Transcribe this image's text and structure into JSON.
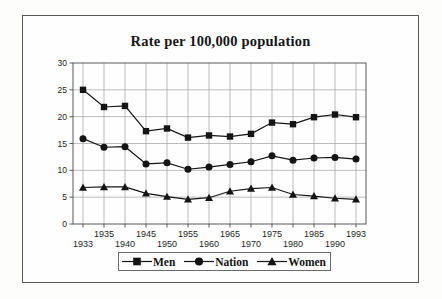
{
  "chart_data": {
    "type": "line",
    "title": "Rate per 100,000 population",
    "categories": [
      "1933",
      "1935",
      "1940",
      "1945",
      "1950",
      "1955",
      "1960",
      "1965",
      "1970",
      "1975",
      "1980",
      "1985",
      "1990",
      "1993"
    ],
    "series": [
      {
        "name": "Men",
        "marker": "square",
        "values": [
          25.0,
          21.8,
          22.0,
          17.3,
          17.8,
          16.1,
          16.5,
          16.3,
          16.8,
          18.9,
          18.6,
          19.9,
          20.4,
          19.9
        ]
      },
      {
        "name": "Nation",
        "marker": "circle",
        "values": [
          15.9,
          14.3,
          14.4,
          11.2,
          11.4,
          10.2,
          10.6,
          11.1,
          11.6,
          12.7,
          11.9,
          12.3,
          12.4,
          12.1
        ]
      },
      {
        "name": "Women",
        "marker": "triangle",
        "values": [
          6.8,
          6.9,
          6.9,
          5.7,
          5.1,
          4.6,
          4.9,
          6.1,
          6.6,
          6.8,
          5.5,
          5.2,
          4.8,
          4.6
        ]
      }
    ],
    "ylim": [
      0,
      30
    ],
    "yticks": [
      0,
      5,
      10,
      15,
      20,
      25,
      30
    ],
    "x_label_layout": "staggered-two-rows",
    "grid": true,
    "legend_position": "bottom",
    "colors": {
      "series": "#141414",
      "grid": "#ababab",
      "frame": "#595959",
      "text": "#1f1f1f"
    }
  }
}
